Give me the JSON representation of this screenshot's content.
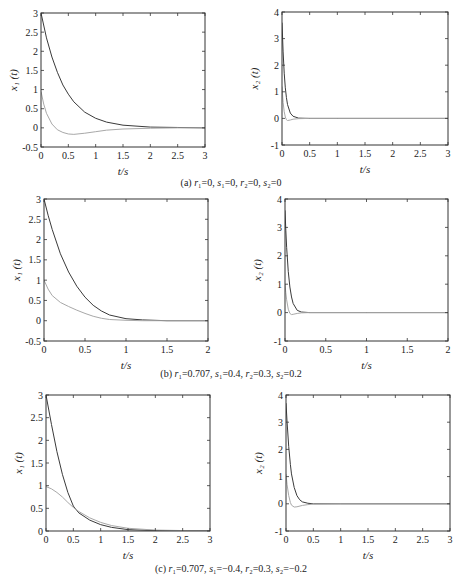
{
  "figure": {
    "rows": [
      {
        "caption": "(a) r₁=0, s₁=0, r₂=0, s₂=0",
        "caption_parts": [
          {
            "t": "(a) ",
            "i": false
          },
          {
            "t": "r",
            "i": true
          },
          {
            "t": "₁=0, ",
            "i": false
          },
          {
            "t": "s",
            "i": true
          },
          {
            "t": "₁=0, ",
            "i": false
          },
          {
            "t": "r",
            "i": true
          },
          {
            "t": "₂=0, ",
            "i": false
          },
          {
            "t": "s",
            "i": true
          },
          {
            "t": "₂=0",
            "i": false
          }
        ]
      },
      {
        "caption": "(b) r₁=0.707, s₁=0.4, r₂=0.3, s₂=0.2",
        "caption_parts": [
          {
            "t": "(b) ",
            "i": false
          },
          {
            "t": "r",
            "i": true
          },
          {
            "t": "₁=0.707, ",
            "i": false
          },
          {
            "t": "s",
            "i": true
          },
          {
            "t": "₁=0.4, ",
            "i": false
          },
          {
            "t": "r",
            "i": true
          },
          {
            "t": "₂=0.3, ",
            "i": false
          },
          {
            "t": "s",
            "i": true
          },
          {
            "t": "₂=0.2",
            "i": false
          }
        ]
      },
      {
        "caption": "(c) r₁=0.707, s₁=−0.4, r₂=0.3, s₂=−0.2",
        "caption_parts": [
          {
            "t": "(c) ",
            "i": false
          },
          {
            "t": "r",
            "i": true
          },
          {
            "t": "₁=0.707, ",
            "i": false
          },
          {
            "t": "s",
            "i": true
          },
          {
            "t": "₁=−0.4, ",
            "i": false
          },
          {
            "t": "r",
            "i": true
          },
          {
            "t": "₂=0.3, ",
            "i": false
          },
          {
            "t": "s",
            "i": true
          },
          {
            "t": "₂=−0.2",
            "i": false
          }
        ]
      }
    ]
  },
  "colors": {
    "axis": "#333333",
    "dark_series": "#3a3a3a",
    "light_series": "#a8a8a8"
  },
  "chart_data": [
    {
      "id": "a-x1",
      "type": "line",
      "title": "",
      "xlabel": "t/s",
      "ylabel": "x₁ (t)",
      "xlim": [
        0,
        3
      ],
      "ylim": [
        -0.5,
        3
      ],
      "grid": false,
      "xticks": [
        0,
        0.5,
        1,
        1.5,
        2,
        2.5,
        3
      ],
      "xtick_labels": [
        "0",
        "0.5",
        "1",
        "1.5",
        "2",
        "2.5",
        "3"
      ],
      "yticks": [
        -0.5,
        0,
        0.5,
        1,
        1.5,
        2,
        2.5,
        3
      ],
      "ytick_labels": [
        "-0.5",
        "0",
        "0.5",
        "1",
        "1.5",
        "2",
        "2.5",
        "3"
      ],
      "series": [
        {
          "name": "dark",
          "x": [
            0,
            0.1,
            0.2,
            0.3,
            0.4,
            0.5,
            0.6,
            0.8,
            1.0,
            1.2,
            1.5,
            2.0,
            2.5,
            3.0
          ],
          "y": [
            3.0,
            2.35,
            1.85,
            1.45,
            1.12,
            0.88,
            0.68,
            0.41,
            0.25,
            0.15,
            0.07,
            0.02,
            0.01,
            0.0
          ]
        },
        {
          "name": "light",
          "x": [
            0,
            0.05,
            0.1,
            0.2,
            0.3,
            0.4,
            0.5,
            0.6,
            0.8,
            1.0,
            1.2,
            1.5,
            2.0,
            2.5,
            3.0
          ],
          "y": [
            0.95,
            0.62,
            0.38,
            0.1,
            -0.05,
            -0.12,
            -0.16,
            -0.17,
            -0.14,
            -0.1,
            -0.06,
            -0.03,
            -0.01,
            0.0,
            0.0
          ]
        }
      ]
    },
    {
      "id": "a-x2",
      "type": "line",
      "title": "",
      "xlabel": "t/s",
      "ylabel": "x₂ (t)",
      "xlim": [
        0,
        3
      ],
      "ylim": [
        -1,
        4
      ],
      "grid": false,
      "xticks": [
        0,
        0.5,
        1,
        1.5,
        2,
        2.5,
        3
      ],
      "xtick_labels": [
        "0",
        "0.5",
        "1",
        "1.5",
        "2",
        "2.5",
        "3"
      ],
      "yticks": [
        -1,
        0,
        1,
        2,
        3,
        4
      ],
      "ytick_labels": [
        "-1",
        "0",
        "1",
        "2",
        "3",
        "4"
      ],
      "series": [
        {
          "name": "dark",
          "x": [
            0,
            0.02,
            0.04,
            0.06,
            0.08,
            0.1,
            0.15,
            0.2,
            0.3,
            0.5,
            1,
            3
          ],
          "y": [
            3.6,
            2.5,
            1.7,
            1.15,
            0.78,
            0.52,
            0.2,
            0.08,
            0.01,
            0.0,
            0.0,
            0.0
          ]
        },
        {
          "name": "light",
          "x": [
            0,
            0.02,
            0.04,
            0.06,
            0.08,
            0.1,
            0.15,
            0.2,
            0.3,
            0.5,
            1,
            3
          ],
          "y": [
            1.2,
            0.6,
            0.25,
            0.05,
            -0.05,
            -0.08,
            -0.06,
            -0.03,
            -0.01,
            0.0,
            0.0,
            0.0
          ]
        }
      ]
    },
    {
      "id": "b-x1",
      "type": "line",
      "title": "",
      "xlabel": "t/s",
      "ylabel": "x₁ (t)",
      "xlim": [
        0,
        2
      ],
      "ylim": [
        -0.5,
        3
      ],
      "grid": false,
      "xticks": [
        0,
        0.5,
        1,
        1.5,
        2
      ],
      "xtick_labels": [
        "0",
        "0.5",
        "1",
        "1.5",
        "2"
      ],
      "yticks": [
        -0.5,
        0,
        0.5,
        1,
        1.5,
        2,
        2.5,
        3
      ],
      "ytick_labels": [
        "-0.5",
        "0",
        "0.5",
        "1",
        "1.5",
        "2",
        "2.5",
        "3"
      ],
      "series": [
        {
          "name": "dark",
          "x": [
            0,
            0.05,
            0.1,
            0.2,
            0.3,
            0.4,
            0.5,
            0.6,
            0.7,
            0.8,
            1.0,
            1.2,
            1.5,
            2.0
          ],
          "y": [
            3.0,
            2.6,
            2.25,
            1.65,
            1.2,
            0.85,
            0.58,
            0.38,
            0.24,
            0.14,
            0.05,
            0.02,
            0.0,
            0.0
          ]
        },
        {
          "name": "light",
          "x": [
            0,
            0.05,
            0.1,
            0.2,
            0.3,
            0.4,
            0.5,
            0.6,
            0.7,
            0.8,
            1.0,
            1.2,
            1.5,
            2.0
          ],
          "y": [
            1.0,
            0.78,
            0.62,
            0.45,
            0.35,
            0.26,
            0.18,
            0.11,
            0.06,
            0.03,
            0.01,
            0.0,
            0.0,
            0.0
          ]
        }
      ]
    },
    {
      "id": "b-x2",
      "type": "line",
      "title": "",
      "xlabel": "t/s",
      "ylabel": "x₂ (t)",
      "xlim": [
        0,
        2
      ],
      "ylim": [
        -1,
        4
      ],
      "grid": false,
      "xticks": [
        0,
        0.5,
        1,
        1.5,
        2
      ],
      "xtick_labels": [
        "0",
        "0.5",
        "1",
        "1.5",
        "2"
      ],
      "yticks": [
        -1,
        0,
        1,
        2,
        3,
        4
      ],
      "ytick_labels": [
        "-1",
        "0",
        "1",
        "2",
        "3",
        "4"
      ],
      "series": [
        {
          "name": "dark",
          "x": [
            0,
            0.01,
            0.02,
            0.04,
            0.06,
            0.08,
            0.1,
            0.15,
            0.2,
            0.3,
            1,
            2
          ],
          "y": [
            3.6,
            2.9,
            2.3,
            1.45,
            0.9,
            0.55,
            0.32,
            0.08,
            0.02,
            0.0,
            0.0,
            0.0
          ]
        },
        {
          "name": "light",
          "x": [
            0,
            0.01,
            0.02,
            0.04,
            0.06,
            0.08,
            0.1,
            0.15,
            0.2,
            0.3,
            1,
            2
          ],
          "y": [
            1.0,
            0.7,
            0.45,
            0.12,
            -0.03,
            -0.07,
            -0.06,
            -0.03,
            -0.01,
            0.0,
            0.0,
            0.0
          ]
        }
      ]
    },
    {
      "id": "c-x1",
      "type": "line",
      "title": "",
      "xlabel": "t/s",
      "ylabel": "x₁ (t)",
      "xlim": [
        0,
        3
      ],
      "ylim": [
        0,
        3
      ],
      "grid": false,
      "xticks": [
        0,
        0.5,
        1,
        1.5,
        2,
        2.5,
        3
      ],
      "xtick_labels": [
        "0",
        "0.5",
        "1",
        "1.5",
        "2",
        "2.5",
        "3"
      ],
      "yticks": [
        0,
        0.5,
        1,
        1.5,
        2,
        2.5,
        3
      ],
      "ytick_labels": [
        "0",
        "0.5",
        "1",
        "1.5",
        "2",
        "2.5",
        "3"
      ],
      "series": [
        {
          "name": "dark",
          "x": [
            0,
            0.1,
            0.2,
            0.3,
            0.4,
            0.5,
            0.6,
            0.8,
            1.0,
            1.2,
            1.5,
            2.0,
            2.5,
            3.0
          ],
          "y": [
            3.0,
            2.35,
            1.75,
            1.25,
            0.85,
            0.55,
            0.4,
            0.24,
            0.14,
            0.08,
            0.03,
            0.01,
            0.0,
            0.0
          ]
        },
        {
          "name": "light",
          "x": [
            0,
            0.1,
            0.2,
            0.3,
            0.4,
            0.5,
            0.6,
            0.8,
            1.0,
            1.2,
            1.5,
            2.0,
            2.5,
            3.0
          ],
          "y": [
            0.98,
            0.93,
            0.85,
            0.75,
            0.63,
            0.52,
            0.43,
            0.29,
            0.19,
            0.12,
            0.06,
            0.02,
            0.01,
            0.0
          ]
        }
      ]
    },
    {
      "id": "c-x2",
      "type": "line",
      "title": "",
      "xlabel": "t/s",
      "ylabel": "x₂ (t)",
      "xlim": [
        0,
        3
      ],
      "ylim": [
        -1,
        4
      ],
      "grid": false,
      "xticks": [
        0,
        0.5,
        1,
        1.5,
        2,
        2.5,
        3
      ],
      "xtick_labels": [
        "0",
        "0.5",
        "1",
        "1.5",
        "2",
        "2.5",
        "3"
      ],
      "yticks": [
        -1,
        0,
        1,
        2,
        3,
        4
      ],
      "ytick_labels": [
        "-1",
        "0",
        "1",
        "2",
        "3",
        "4"
      ],
      "series": [
        {
          "name": "dark",
          "x": [
            0,
            0.02,
            0.05,
            0.08,
            0.1,
            0.15,
            0.2,
            0.25,
            0.3,
            0.4,
            0.5,
            1,
            3
          ],
          "y": [
            3.7,
            3.0,
            2.1,
            1.45,
            1.1,
            0.6,
            0.3,
            0.15,
            0.07,
            0.02,
            0.0,
            0.0,
            0.0
          ]
        },
        {
          "name": "light",
          "x": [
            0,
            0.02,
            0.05,
            0.08,
            0.1,
            0.15,
            0.2,
            0.3,
            0.4,
            0.5,
            1,
            3
          ],
          "y": [
            1.1,
            0.7,
            0.3,
            0.05,
            -0.05,
            -0.12,
            -0.11,
            -0.06,
            -0.03,
            -0.01,
            0.0,
            0.0
          ]
        }
      ]
    }
  ]
}
